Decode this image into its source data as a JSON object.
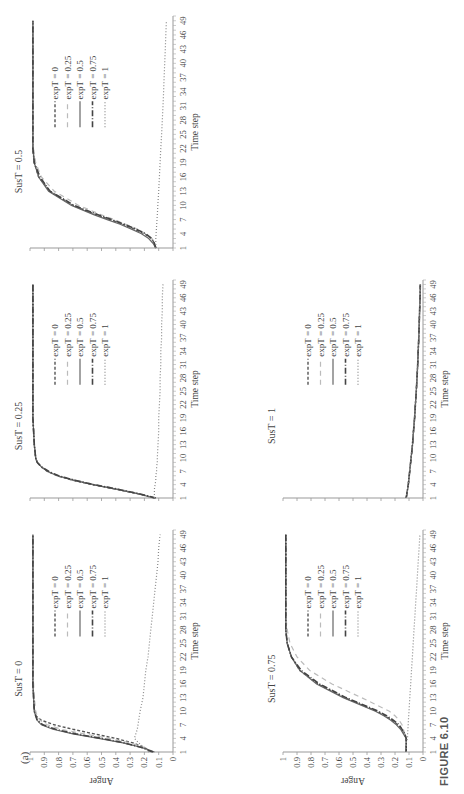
{
  "figure": {
    "panel_label": "(a)",
    "caption": "FIGURE 6.10",
    "orientation": "rotated 90 degrees counter-clockwise"
  },
  "legend_entries": [
    "expT = 0",
    "expT = 0.25",
    "expT = 0.5",
    "expT = 0.75",
    "expT = 1"
  ],
  "axis": {
    "xlabel": "Time step",
    "ylabel": "Anger",
    "x_ticks": [
      "1",
      "4",
      "7",
      "10",
      "13",
      "16",
      "19",
      "22",
      "25",
      "28",
      "31",
      "34",
      "37",
      "40",
      "43",
      "46",
      "49"
    ],
    "y_ticks": [
      "0",
      "0.1",
      "0.2",
      "0.3",
      "0.4",
      "0.5",
      "0.6",
      "0.7",
      "0.8",
      "0.9",
      "1"
    ]
  },
  "chart_data": [
    {
      "type": "line",
      "title": "SusT = 0",
      "xlabel": "Time step",
      "ylabel": "Anger",
      "xlim": [
        1,
        50
      ],
      "ylim": [
        0,
        1
      ],
      "grid": false,
      "legend_position": "inside-right",
      "x": [
        1,
        2,
        3,
        4,
        5,
        6,
        7,
        8,
        9,
        10,
        13,
        16,
        19,
        22,
        25,
        28,
        31,
        34,
        37,
        40,
        43,
        46,
        49
      ],
      "series": [
        {
          "name": "expT = 0",
          "values": [
            0.15,
            0.2,
            0.28,
            0.4,
            0.55,
            0.7,
            0.83,
            0.92,
            0.96,
            0.97,
            0.975,
            0.98,
            0.98,
            0.98,
            0.98,
            0.98,
            0.98,
            0.98,
            0.98,
            0.98,
            0.98,
            0.98,
            0.98
          ]
        },
        {
          "name": "expT = 0.25",
          "values": [
            0.13,
            0.2,
            0.3,
            0.45,
            0.62,
            0.78,
            0.88,
            0.93,
            0.95,
            0.96,
            0.97,
            0.975,
            0.98,
            0.98,
            0.98,
            0.98,
            0.98,
            0.98,
            0.98,
            0.98,
            0.98,
            0.98,
            0.98
          ]
        },
        {
          "name": "expT = 0.5",
          "values": [
            0.13,
            0.22,
            0.35,
            0.52,
            0.7,
            0.84,
            0.92,
            0.95,
            0.96,
            0.97,
            0.975,
            0.98,
            0.98,
            0.98,
            0.98,
            0.98,
            0.98,
            0.98,
            0.98,
            0.98,
            0.98,
            0.98,
            0.98
          ]
        },
        {
          "name": "expT = 0.75",
          "values": [
            0.14,
            0.22,
            0.34,
            0.5,
            0.68,
            0.82,
            0.91,
            0.95,
            0.96,
            0.97,
            0.975,
            0.98,
            0.98,
            0.98,
            0.98,
            0.98,
            0.98,
            0.98,
            0.98,
            0.98,
            0.98,
            0.98,
            0.98
          ]
        },
        {
          "name": "expT = 1",
          "values": [
            0.17,
            0.2,
            0.24,
            0.27,
            0.26,
            0.25,
            0.245,
            0.24,
            0.235,
            0.23,
            0.21,
            0.2,
            0.19,
            0.175,
            0.165,
            0.155,
            0.145,
            0.135,
            0.125,
            0.115,
            0.105,
            0.1,
            0.09
          ]
        }
      ]
    },
    {
      "type": "line",
      "title": "SusT = 0.25",
      "xlabel": "Time step",
      "ylabel": "Anger",
      "xlim": [
        1,
        50
      ],
      "ylim": [
        0,
        1
      ],
      "grid": false,
      "legend_position": "inside-right",
      "x": [
        1,
        2,
        3,
        4,
        5,
        6,
        7,
        8,
        9,
        10,
        13,
        16,
        19,
        22,
        25,
        28,
        31,
        34,
        37,
        40,
        43,
        46,
        49
      ],
      "series": [
        {
          "name": "expT = 0",
          "values": [
            0.13,
            0.25,
            0.4,
            0.56,
            0.7,
            0.81,
            0.88,
            0.92,
            0.95,
            0.96,
            0.97,
            0.975,
            0.98,
            0.98,
            0.98,
            0.98,
            0.98,
            0.98,
            0.98,
            0.98,
            0.98,
            0.98,
            0.98
          ]
        },
        {
          "name": "expT = 0.25",
          "values": [
            0.13,
            0.24,
            0.38,
            0.54,
            0.68,
            0.8,
            0.88,
            0.92,
            0.95,
            0.96,
            0.97,
            0.975,
            0.98,
            0.98,
            0.98,
            0.98,
            0.98,
            0.98,
            0.98,
            0.98,
            0.98,
            0.98,
            0.98
          ]
        },
        {
          "name": "expT = 0.5",
          "values": [
            0.13,
            0.25,
            0.4,
            0.56,
            0.7,
            0.81,
            0.88,
            0.92,
            0.95,
            0.96,
            0.97,
            0.975,
            0.98,
            0.98,
            0.98,
            0.98,
            0.98,
            0.98,
            0.98,
            0.98,
            0.98,
            0.98,
            0.98
          ]
        },
        {
          "name": "expT = 0.75",
          "values": [
            0.12,
            0.24,
            0.39,
            0.55,
            0.69,
            0.8,
            0.87,
            0.92,
            0.95,
            0.96,
            0.97,
            0.975,
            0.98,
            0.98,
            0.98,
            0.98,
            0.98,
            0.98,
            0.98,
            0.98,
            0.98,
            0.98,
            0.98
          ]
        },
        {
          "name": "expT = 1",
          "values": [
            0.13,
            0.13,
            0.13,
            0.125,
            0.12,
            0.12,
            0.115,
            0.115,
            0.11,
            0.11,
            0.105,
            0.1,
            0.1,
            0.095,
            0.09,
            0.09,
            0.085,
            0.085,
            0.08,
            0.08,
            0.075,
            0.075,
            0.07
          ]
        }
      ]
    },
    {
      "type": "line",
      "title": "SusT = 0.5",
      "xlabel": "Time step",
      "ylabel": "Anger",
      "xlim": [
        1,
        50
      ],
      "ylim": [
        0,
        1
      ],
      "grid": false,
      "legend_position": "inside-right",
      "x": [
        1,
        2,
        3,
        4,
        5,
        6,
        7,
        8,
        9,
        10,
        13,
        16,
        19,
        22,
        25,
        28,
        31,
        34,
        37,
        40,
        43,
        46,
        49
      ],
      "series": [
        {
          "name": "expT = 0",
          "values": [
            0.12,
            0.13,
            0.15,
            0.2,
            0.27,
            0.35,
            0.44,
            0.53,
            0.62,
            0.7,
            0.86,
            0.94,
            0.97,
            0.98,
            0.98,
            0.98,
            0.98,
            0.98,
            0.98,
            0.98,
            0.98,
            0.98,
            0.98
          ]
        },
        {
          "name": "expT = 0.25",
          "values": [
            0.12,
            0.13,
            0.15,
            0.19,
            0.25,
            0.33,
            0.41,
            0.5,
            0.58,
            0.66,
            0.83,
            0.92,
            0.96,
            0.975,
            0.98,
            0.98,
            0.98,
            0.98,
            0.98,
            0.98,
            0.98,
            0.98,
            0.98
          ]
        },
        {
          "name": "expT = 0.5",
          "values": [
            0.12,
            0.14,
            0.17,
            0.22,
            0.29,
            0.37,
            0.46,
            0.55,
            0.63,
            0.71,
            0.87,
            0.94,
            0.97,
            0.98,
            0.98,
            0.98,
            0.98,
            0.98,
            0.98,
            0.98,
            0.98,
            0.98,
            0.98
          ]
        },
        {
          "name": "expT = 0.75",
          "values": [
            0.12,
            0.13,
            0.15,
            0.19,
            0.26,
            0.34,
            0.43,
            0.52,
            0.61,
            0.69,
            0.86,
            0.93,
            0.97,
            0.98,
            0.98,
            0.98,
            0.98,
            0.98,
            0.98,
            0.98,
            0.98,
            0.98,
            0.98
          ]
        },
        {
          "name": "expT = 1",
          "values": [
            0.12,
            0.12,
            0.12,
            0.118,
            0.116,
            0.114,
            0.112,
            0.11,
            0.108,
            0.106,
            0.1,
            0.095,
            0.09,
            0.085,
            0.08,
            0.075,
            0.07,
            0.066,
            0.062,
            0.058,
            0.054,
            0.05,
            0.046
          ]
        }
      ]
    },
    {
      "type": "line",
      "title": "SusT = 0.75",
      "xlabel": "Time step",
      "ylabel": "Anger",
      "xlim": [
        1,
        50
      ],
      "ylim": [
        0,
        1
      ],
      "grid": false,
      "legend_position": "inside-right",
      "x": [
        1,
        2,
        3,
        4,
        5,
        6,
        7,
        8,
        9,
        10,
        13,
        16,
        19,
        22,
        25,
        28,
        31,
        34,
        37,
        40,
        43,
        46,
        49
      ],
      "series": [
        {
          "name": "expT = 0",
          "values": [
            0.12,
            0.12,
            0.12,
            0.12,
            0.13,
            0.15,
            0.18,
            0.22,
            0.27,
            0.33,
            0.56,
            0.75,
            0.88,
            0.94,
            0.97,
            0.98,
            0.98,
            0.98,
            0.98,
            0.98,
            0.98,
            0.98,
            0.98
          ]
        },
        {
          "name": "expT = 0.25",
          "values": [
            0.12,
            0.12,
            0.12,
            0.12,
            0.13,
            0.14,
            0.15,
            0.17,
            0.2,
            0.24,
            0.44,
            0.65,
            0.81,
            0.9,
            0.95,
            0.97,
            0.98,
            0.98,
            0.98,
            0.98,
            0.98,
            0.98,
            0.98
          ]
        },
        {
          "name": "expT = 0.5",
          "values": [
            0.12,
            0.12,
            0.12,
            0.12,
            0.14,
            0.16,
            0.19,
            0.23,
            0.28,
            0.34,
            0.57,
            0.76,
            0.88,
            0.94,
            0.97,
            0.98,
            0.98,
            0.98,
            0.98,
            0.98,
            0.98,
            0.98,
            0.98
          ]
        },
        {
          "name": "expT = 0.75",
          "values": [
            0.12,
            0.12,
            0.12,
            0.12,
            0.13,
            0.15,
            0.17,
            0.21,
            0.26,
            0.32,
            0.55,
            0.74,
            0.87,
            0.94,
            0.97,
            0.98,
            0.98,
            0.98,
            0.98,
            0.98,
            0.98,
            0.98,
            0.98
          ]
        },
        {
          "name": "expT = 1",
          "values": [
            0.12,
            0.12,
            0.12,
            0.11,
            0.11,
            0.108,
            0.106,
            0.104,
            0.102,
            0.1,
            0.094,
            0.088,
            0.082,
            0.076,
            0.07,
            0.064,
            0.058,
            0.052,
            0.046,
            0.04,
            0.034,
            0.028,
            0.022
          ]
        }
      ]
    },
    {
      "type": "line",
      "title": "SusT = 1",
      "xlabel": "Time step",
      "ylabel": "Anger",
      "xlim": [
        1,
        50
      ],
      "ylim": [
        0,
        1
      ],
      "grid": false,
      "legend_position": "inside-right",
      "x": [
        1,
        4,
        7,
        10,
        13,
        16,
        19,
        22,
        25,
        28,
        31,
        34,
        37,
        40,
        43,
        46,
        49
      ],
      "series": [
        {
          "name": "expT = 0",
          "values": [
            0.12,
            0.105,
            0.095,
            0.085,
            0.075,
            0.068,
            0.06,
            0.054,
            0.048,
            0.043,
            0.038,
            0.034,
            0.03,
            0.027,
            0.024,
            0.021,
            0.019
          ]
        },
        {
          "name": "expT = 0.25",
          "values": [
            0.12,
            0.105,
            0.095,
            0.085,
            0.075,
            0.068,
            0.06,
            0.054,
            0.048,
            0.043,
            0.038,
            0.034,
            0.03,
            0.027,
            0.024,
            0.021,
            0.019
          ]
        },
        {
          "name": "expT = 0.5",
          "values": [
            0.12,
            0.105,
            0.095,
            0.085,
            0.075,
            0.068,
            0.06,
            0.054,
            0.048,
            0.043,
            0.038,
            0.034,
            0.03,
            0.027,
            0.024,
            0.021,
            0.019
          ]
        },
        {
          "name": "expT = 0.75",
          "values": [
            0.12,
            0.105,
            0.095,
            0.085,
            0.075,
            0.068,
            0.06,
            0.054,
            0.048,
            0.043,
            0.038,
            0.034,
            0.03,
            0.027,
            0.024,
            0.021,
            0.019
          ]
        },
        {
          "name": "expT = 1",
          "values": [
            0.12,
            0.105,
            0.095,
            0.085,
            0.075,
            0.068,
            0.06,
            0.054,
            0.048,
            0.043,
            0.038,
            0.034,
            0.03,
            0.027,
            0.024,
            0.021,
            0.019
          ]
        }
      ]
    }
  ],
  "styles": {
    "series": [
      {
        "color": "#555555",
        "dash": "3,2",
        "width": 1.4
      },
      {
        "color": "#bbbbbb",
        "dash": "5,4",
        "width": 1.2
      },
      {
        "color": "#666666",
        "dash": "",
        "width": 1.2
      },
      {
        "color": "#444444",
        "dash": "6,2,1,2",
        "width": 1.6
      },
      {
        "color": "#888888",
        "dash": "1,2",
        "width": 1.2
      }
    ]
  }
}
